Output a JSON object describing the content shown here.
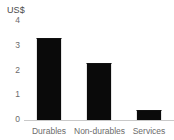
{
  "chart_data": {
    "type": "bar",
    "title": "",
    "subtitle": "",
    "xlabel": "",
    "ylabel": "US$",
    "unit_label": "US$",
    "categories": [
      "Durables",
      "Non-durables",
      "Services"
    ],
    "values": [
      3.3,
      2.3,
      0.4
    ],
    "series": [
      {
        "name": "US$",
        "values": [
          3.3,
          2.3,
          0.4
        ]
      }
    ],
    "ylim": [
      0,
      4
    ],
    "yticks": [
      "0",
      "1",
      "2",
      "3",
      "4"
    ],
    "ytick_values": [
      0,
      1,
      2,
      3,
      4
    ],
    "grid": false,
    "legend": false,
    "legend_position": "none",
    "colors": {
      "bar": "#0a0a0a",
      "axis": "#c9c9c9",
      "tick_text": "#6b6b6b",
      "unit_text": "#4a4a4a",
      "background": "#ffffff"
    }
  }
}
